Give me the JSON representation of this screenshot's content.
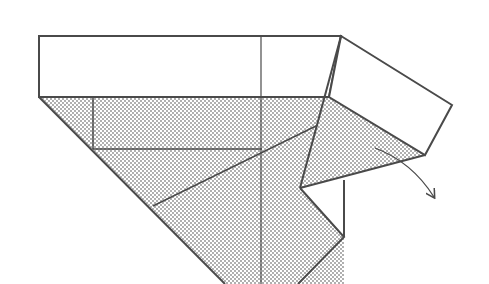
{
  "diagram": {
    "type": "origami-fold-step",
    "colors": {
      "line": "#4a4a4a",
      "paper_front": "#ffffff",
      "paper_back_dot": "#8a8a8a"
    },
    "annotations": {
      "fold_arrow": "curved arrow indicating fold direction"
    }
  }
}
